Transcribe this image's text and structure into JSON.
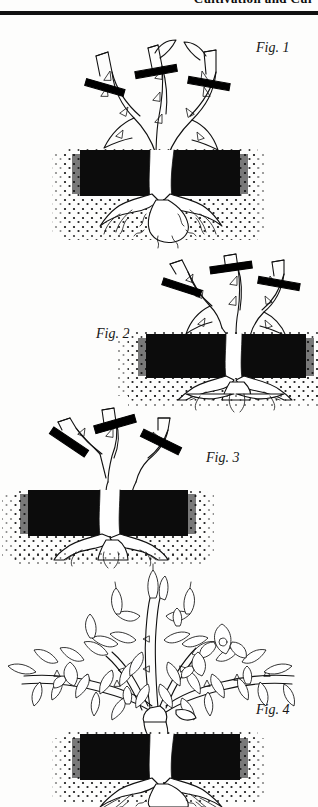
{
  "page": {
    "running_head": "Cultivation and Cul",
    "background_color": "#fdfdfc",
    "ink_color": "#111111"
  },
  "figures": [
    {
      "id": "fig-1",
      "label": "Fig. 1",
      "label_side": "right",
      "description": "Rose bush with three long canes, each marked with a heavy black pruning cut bar; root ball shown in cross-section below a dark topsoil layer",
      "cane_count": 3,
      "cut_marks": 3,
      "stage": "unpruned bush with cut positions indicated"
    },
    {
      "id": "fig-2",
      "label": "Fig. 2",
      "label_side": "left",
      "description": "Rose bush pruned back to medium-length canes, each with a black cut bar; soil block shifted to the right of the frame",
      "cane_count": 3,
      "cut_marks": 3,
      "stage": "moderate pruning"
    },
    {
      "id": "fig-3",
      "label": "Fig. 3",
      "label_side": "right",
      "description": "Rose bush pruned hard to short stubs, each stub crossed by a black cut bar; soil block shifted to the left of the frame",
      "cane_count": 3,
      "cut_marks": 3,
      "stage": "hard pruning"
    },
    {
      "id": "fig-4",
      "label": "Fig. 4",
      "label_side": "right",
      "description": "Mature rose bush in full growth with leaves, buds and open blooms on arching canes above the soil cross-section",
      "cane_count": 5,
      "cut_marks": 0,
      "stage": "resulting growth after pruning"
    }
  ],
  "soil": {
    "topsoil_label": "dark stippled topsoil layer",
    "subsoil_label": "light stippled subsoil with root system",
    "topsoil_color": "#111111",
    "subsoil_color": "#ffffff"
  }
}
